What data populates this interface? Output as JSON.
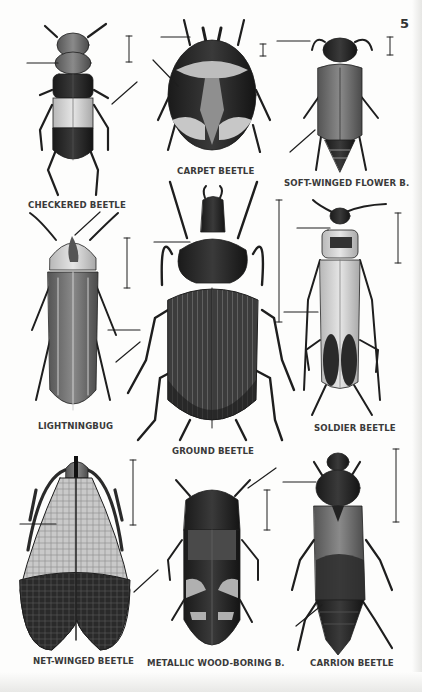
{
  "page": {
    "number": "5",
    "colors": {
      "paper": "#fdfdfc",
      "ink": "#1e1e1e",
      "label": "#3a3a3a"
    }
  },
  "beetles": [
    {
      "name": "CHECKERED BEETLE"
    },
    {
      "name": "CARPET BEETLE"
    },
    {
      "name": "SOFT-WINGED FLOWER B."
    },
    {
      "name": "LIGHTNINGBUG"
    },
    {
      "name": "GROUND BEETLE"
    },
    {
      "name": "SOLDIER BEETLE"
    },
    {
      "name": "NET-WINGED BEETLE"
    },
    {
      "name": "METALLIC WOOD-BORING B."
    },
    {
      "name": "CARRION BEETLE"
    }
  ]
}
